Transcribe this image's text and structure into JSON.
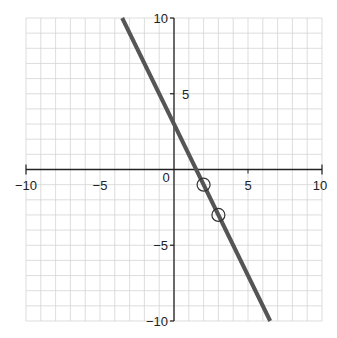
{
  "chart_data": {
    "type": "line",
    "title": "",
    "xlabel": "",
    "ylabel": "",
    "xlim": [
      -10,
      10
    ],
    "ylim": [
      -10,
      10
    ],
    "grid": true,
    "grid_step": 1,
    "x_ticks": [
      -10,
      -5,
      0,
      5,
      10
    ],
    "y_ticks": [
      -10,
      -5,
      5,
      10
    ],
    "x_tick_labels": [
      "−10",
      "−5",
      "0",
      "5",
      "10"
    ],
    "y_tick_labels": [
      "−10",
      "−5",
      "5",
      "10"
    ],
    "series": [
      {
        "name": "y = -2x + 3",
        "slope": -2,
        "intercept": 3,
        "x": [
          -3.5,
          6.5
        ],
        "y": [
          10,
          -10
        ],
        "color": "#555555"
      }
    ],
    "marked_points": [
      {
        "x": 2,
        "y": -1
      },
      {
        "x": 3,
        "y": -3
      }
    ],
    "colors": {
      "grid": "#d4d4d4",
      "axis": "#222222",
      "line": "#555555"
    }
  }
}
